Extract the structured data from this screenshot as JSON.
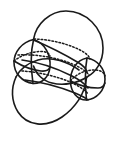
{
  "figure": {
    "kind": "line-drawing",
    "background_color": "#ffffff",
    "ink_color": "#1a1a1a",
    "canvas": {
      "width": 120,
      "height": 150
    },
    "caption": "",
    "labels": []
  },
  "chart_data": {
    "type": "diagram",
    "xlabel": "",
    "ylabel": "",
    "elements": [
      {
        "name": "upper-right-sphere-outline",
        "style": "solid",
        "role": "visible-silhouette",
        "path": "M 33.5 39.5 C 36 24 50 11 66 11 C 86 11 103 28 103 48 C 103 62 96 72 87 77"
      },
      {
        "name": "upper-right-sphere-lower-arc",
        "style": "solid",
        "role": "visible-silhouette",
        "path": "M 87 77 C 78 83 64 86 52 83 C 43 81 36 74 33.5 66"
      },
      {
        "name": "lower-left-sphere-outline",
        "style": "solid",
        "role": "visible-silhouette",
        "path": "M 86.5 78 C 85 94 75 108 62 117 C 46 128 27 126 18 112 C 11 101 11 88 16 77"
      },
      {
        "name": "lower-left-sphere-upper-arc",
        "style": "solid",
        "role": "visible-silhouette",
        "path": "M 16 77 C 20 69 28 63 38 60 C 52 56 68 62 79 70"
      },
      {
        "name": "left-small-sphere-circle",
        "style": "solid",
        "role": "visible-silhouette",
        "path": "M 33.5 39.5 C 22 42 14 52 14 62.5 C 14 73 22 82 33 83.5 C 42 84 49 77 50 67 C 51 55 45 43 33.5 39.5 Z"
      },
      {
        "name": "right-small-sphere-circle",
        "style": "solid",
        "role": "visible-silhouette",
        "path": "M 87 58 C 98 60 105 69 105 79 C 105 90 97 99 86.5 100 C 77 100 71 92 70.5 82 C 70 71 76 60 87 58 Z"
      },
      {
        "name": "left-sphere-equator-front",
        "style": "solid",
        "role": "visible-great-circle",
        "path": "M 14 61 C 22 66 32 70 41 71 C 46 71.5 49 70 50 67"
      },
      {
        "name": "left-sphere-equator-hidden",
        "style": "dashed",
        "role": "hidden-great-circle",
        "path": "M 14 61 C 20 56 30 52 39 51.5 C 45 51 49 53 50 56"
      },
      {
        "name": "right-sphere-equator-front",
        "style": "solid",
        "role": "visible-great-circle",
        "path": "M 70.5 81 C 78 85 89 88 98 88 C 102 88 104 86 105 83"
      },
      {
        "name": "right-sphere-equator-hidden",
        "style": "dashed",
        "role": "hidden-great-circle",
        "path": "M 70.5 81 C 76 74 85 70 94 70 C 100 70 104 72 105 76"
      },
      {
        "name": "upper-band-edge-solid",
        "style": "solid",
        "role": "visible-intersection-curve",
        "path": "M 33.5 40 C 48 46 64 54 79 63 C 84 66 86 69 87 72"
      },
      {
        "name": "upper-band-edge-dashed",
        "style": "dashed",
        "role": "hidden-intersection-curve",
        "path": "M 34 39 C 49 39.5 66 43 80 50 C 86 53 89 56 90 59"
      },
      {
        "name": "middle-band-edge-solid",
        "style": "solid",
        "role": "visible-intersection-curve",
        "path": "M 22 60 C 38 62 56 68 72 76 C 80 80 85 84 88 88"
      },
      {
        "name": "middle-band-edge-dashed",
        "style": "dashed",
        "role": "hidden-intersection-curve",
        "path": "M 18 55 C 35 54 54 57 70 63 C 80 67 86 71 89 75"
      },
      {
        "name": "lower-band-edge-solid",
        "style": "solid",
        "role": "visible-intersection-curve",
        "path": "M 25 80 C 42 82 60 87 75 93 C 82 96 86 98 88 100"
      },
      {
        "name": "lower-band-edge-dashed",
        "style": "dashed",
        "role": "hidden-intersection-curve",
        "path": "M 22 71 C 38 72 56 76 70 82 C 79 86 85 90 88 94"
      },
      {
        "name": "left-cap-short-chord",
        "style": "solid",
        "role": "visible-edge",
        "path": "M 33.5 40 C 31 50 30 62 33 83.5"
      },
      {
        "name": "right-cap-short-chord",
        "style": "solid",
        "role": "visible-edge",
        "path": "M 87 58 C 85 69 85 84 86.5 100"
      }
    ]
  }
}
